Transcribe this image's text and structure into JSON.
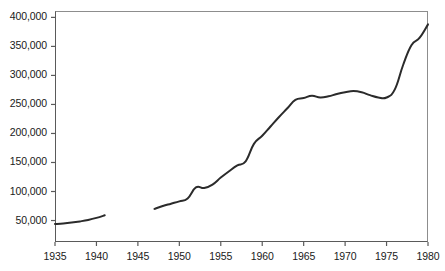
{
  "chart_data": {
    "type": "line",
    "title": "",
    "subtitle": "",
    "xlabel": "",
    "ylabel": "",
    "xlim": [
      1935,
      1980
    ],
    "ylim": [
      13000,
      411000
    ],
    "grid": false,
    "legend": null,
    "annotations": [],
    "yticks": [
      50000,
      100000,
      150000,
      200000,
      250000,
      300000,
      350000,
      400000
    ],
    "ytick_labels": [
      "50,000",
      "100,000",
      "150,000",
      "200,000",
      "250,000",
      "300,000",
      "350,000",
      "400,000"
    ],
    "xticks": [
      1935,
      1940,
      1945,
      1950,
      1955,
      1960,
      1965,
      1970,
      1975,
      1980
    ],
    "xtick_labels": [
      "1935",
      "1940",
      "1945",
      "1950",
      "1955",
      "1960",
      "1965",
      "1970",
      "1975",
      "1980"
    ],
    "line_color": "#2b2b2b",
    "line_width": 2,
    "series": [
      {
        "name": "segment-prewar",
        "x": [
          1935,
          1936,
          1937,
          1938,
          1939,
          1940,
          1941
        ],
        "values": [
          44000,
          45000,
          46500,
          48500,
          51000,
          54500,
          59000
        ]
      },
      {
        "name": "segment-postwar",
        "x": [
          1947,
          1948,
          1949,
          1950,
          1951,
          1952,
          1953,
          1954,
          1955,
          1956,
          1957,
          1958,
          1959,
          1960,
          1961,
          1962,
          1963,
          1964,
          1965,
          1966,
          1967,
          1968,
          1969,
          1970,
          1971,
          1972,
          1973,
          1974,
          1975,
          1976,
          1977,
          1978,
          1979,
          1980
        ],
        "values": [
          70000,
          75000,
          79000,
          83000,
          88000,
          107000,
          106000,
          112000,
          124000,
          135000,
          145000,
          152000,
          182000,
          196000,
          212000,
          228000,
          243000,
          258000,
          261000,
          265000,
          262000,
          264000,
          268000,
          271000,
          273000,
          271000,
          266000,
          262000,
          262000,
          276000,
          318000,
          352000,
          365000,
          388000
        ]
      }
    ]
  }
}
